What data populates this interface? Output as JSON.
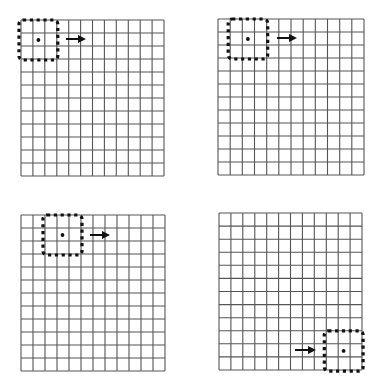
{
  "figure": {
    "colors": {
      "grid_line": "#555555",
      "window": "#111111",
      "arrow": "#111111",
      "background": "#ffffff"
    },
    "grid_cols": 12,
    "grid_rows": 12,
    "panels": [
      {
        "id": "panel-1",
        "x": 21,
        "y": 20,
        "w": 143,
        "h": 156,
        "window_col": 0,
        "window_row": 0,
        "arrow": {
          "x1": 66,
          "x2": 89,
          "y": 39
        },
        "arrow_side": "right"
      },
      {
        "id": "panel-2",
        "x": 218,
        "y": 19,
        "w": 146,
        "h": 156,
        "window_col": 1,
        "window_row": 0,
        "arrow": {
          "x1": 277,
          "x2": 300,
          "y": 38
        },
        "arrow_side": "right"
      },
      {
        "id": "panel-3",
        "x": 21,
        "y": 215,
        "w": 144,
        "h": 156,
        "window_col": 2,
        "window_row": 0,
        "arrow": {
          "x1": 90,
          "x2": 113,
          "y": 235
        },
        "arrow_side": "right"
      },
      {
        "id": "panel-4",
        "x": 219,
        "y": 213,
        "w": 143,
        "h": 157,
        "window_col": 9,
        "window_row": 9,
        "arrow": {
          "x1": 295,
          "x2": 319,
          "y": 350
        },
        "arrow_side": "left"
      }
    ]
  }
}
